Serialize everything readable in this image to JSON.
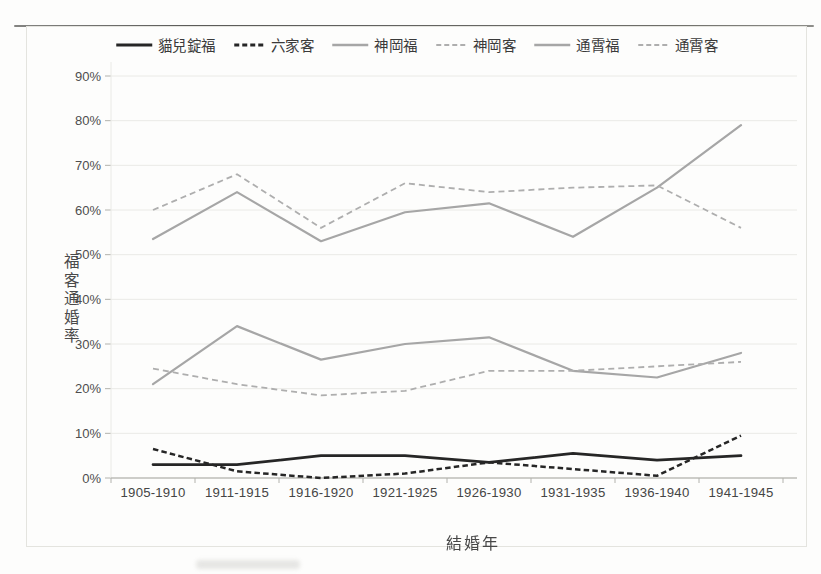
{
  "page": {
    "background": "#fdfdfc",
    "frame_border_color": "#e4e4df",
    "scan_topline_color": "#454543"
  },
  "chart_data": {
    "type": "line",
    "title": "",
    "categories": [
      "1905-1910",
      "1911-1915",
      "1916-1920",
      "1921-1925",
      "1926-1930",
      "1931-1935",
      "1936-1940",
      "1941-1945"
    ],
    "xlabel": "結婚年",
    "ylabel": "福客通婚率",
    "ylim": [
      0,
      90
    ],
    "y_ticks_percent": [
      0,
      10,
      20,
      30,
      40,
      50,
      60,
      70,
      80,
      90
    ],
    "y_tick_labels": [
      "0%",
      "10%",
      "20%",
      "30%",
      "40%",
      "50%",
      "60%",
      "70%",
      "80%",
      "90%"
    ],
    "grid": true,
    "legend_position": "top-center",
    "axis_colors": {
      "gridline": "#eaeae6",
      "axis_line": "#bdbdb8",
      "tick_mark": "#b2b2ad",
      "tick_text": "#4e4e4e"
    },
    "series": [
      {
        "name": "貓兒錠福",
        "style": "solid",
        "color": "#262626",
        "width": 2.7,
        "values": [
          3,
          3,
          5,
          5,
          3.5,
          5.5,
          4,
          5
        ]
      },
      {
        "name": "六家客",
        "style": "dashed",
        "color": "#262626",
        "width": 2.5,
        "values": [
          6.5,
          1.5,
          0,
          1,
          3.5,
          2,
          0.5,
          9.5
        ]
      },
      {
        "name": "神岡福",
        "style": "solid",
        "color": "#a6a6a6",
        "width": 2.2,
        "values": [
          21,
          34,
          26.5,
          30,
          31.5,
          24,
          22.5,
          28
        ]
      },
      {
        "name": "神岡客",
        "style": "dashed",
        "color": "#aeaeae",
        "width": 1.8,
        "values": [
          24.5,
          21,
          18.5,
          19.5,
          24,
          24,
          25,
          26
        ]
      },
      {
        "name": "通霄福",
        "style": "solid",
        "color": "#a6a6a6",
        "width": 2.2,
        "values": [
          53.5,
          64,
          53,
          59.5,
          61.5,
          54,
          65,
          79
        ]
      },
      {
        "name": "通霄客",
        "style": "dashed",
        "color": "#aeaeae",
        "width": 1.8,
        "values": [
          60,
          68,
          56,
          66,
          64,
          65,
          65.5,
          56
        ]
      }
    ]
  }
}
